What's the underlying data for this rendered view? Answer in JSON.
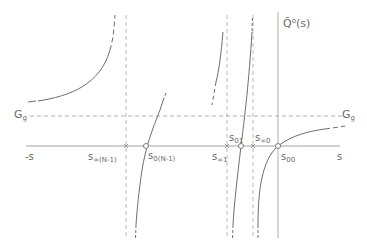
{
  "diagram": {
    "y_axis_label": {
      "main": "Q̄",
      "sup": "o",
      "rest": "(s)"
    },
    "x_axis_label": "s",
    "x_axis_neg_label": "-s",
    "asymptote_label": {
      "main": "G",
      "sub": "g"
    },
    "poles": [
      {
        "main": "s",
        "sub": "∞(N-1)"
      },
      {
        "main": "s",
        "sub": "∞1"
      },
      {
        "main": "s",
        "sub": "∞0"
      }
    ],
    "zeros": [
      {
        "main": "s",
        "sub": "0(N-1)"
      },
      {
        "main": "s",
        "sub": "01"
      },
      {
        "main": "s",
        "sub": "00"
      }
    ],
    "colors": {
      "line": "#6e6e6e",
      "dashed": "#9a9a9a",
      "text": "#6a6a6a"
    }
  }
}
